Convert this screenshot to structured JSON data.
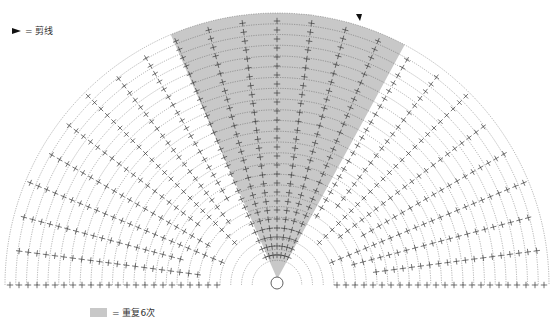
{
  "diagram": {
    "type": "crochet-chart",
    "shape": "semicircle-fan",
    "center": [
      277,
      285
    ],
    "outer_radius": 272,
    "rounds": 24,
    "spokes": 25,
    "shaded_sector_deg": [
      62,
      113
    ],
    "colors": {
      "shade": "#c8c8c8",
      "stroke": "#3a3a3a",
      "background": "#ffffff"
    }
  },
  "legend": {
    "cut_yarn": {
      "symbol": "►",
      "label": "= 剪线"
    },
    "repeat": {
      "label": "= 重复6次"
    }
  }
}
